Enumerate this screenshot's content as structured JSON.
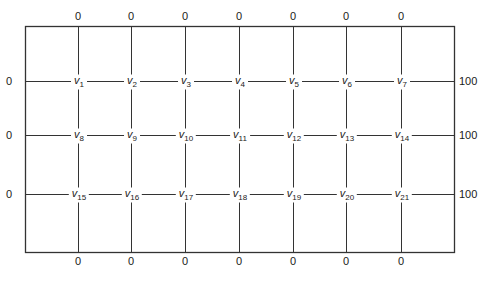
{
  "diagram": {
    "title": "",
    "type": "grid-boundary-value-mesh",
    "box": {
      "left": 25,
      "top": 26,
      "right": 454,
      "bottom": 252
    },
    "columns_x": [
      78,
      131,
      185,
      239,
      293,
      346,
      401
    ],
    "rows_y": [
      81,
      135,
      194
    ],
    "line_color": "#333333",
    "top_boundary_values": [
      "0",
      "0",
      "0",
      "0",
      "0",
      "0",
      "0"
    ],
    "bottom_boundary_values": [
      "0",
      "0",
      "0",
      "0",
      "0",
      "0",
      "0"
    ],
    "left_boundary_values": [
      "0",
      "0",
      "0"
    ],
    "right_boundary_values": [
      "100",
      "100",
      "100"
    ],
    "node_symbol": "v",
    "nodes": [
      [
        "1",
        "2",
        "3",
        "4",
        "5",
        "6",
        "7"
      ],
      [
        "8",
        "9",
        "10",
        "11",
        "12",
        "13",
        "14"
      ],
      [
        "15",
        "16",
        "17",
        "18",
        "19",
        "20",
        "21"
      ]
    ]
  }
}
